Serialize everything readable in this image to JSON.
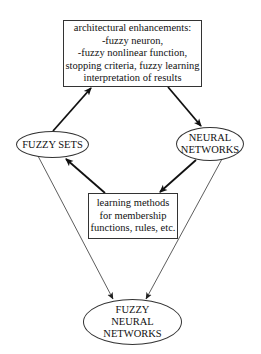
{
  "diagram": {
    "nodes": {
      "enhancements": {
        "shape": "rectangle",
        "lines": [
          "architectural enhancements:",
          "-fuzzy neuron,",
          "-fuzzy nonlinear function,",
          "stopping criteria, fuzzy learning",
          "interpretation of results"
        ]
      },
      "fuzzy_sets": {
        "shape": "ellipse",
        "lines": [
          "FUZZY SETS"
        ]
      },
      "neural_networks": {
        "shape": "ellipse",
        "lines": [
          "NEURAL",
          "NETWORKS"
        ]
      },
      "learning_methods": {
        "shape": "rectangle",
        "lines": [
          "learning methods",
          "for membership",
          "functions, rules, etc."
        ]
      },
      "fuzzy_neural_networks": {
        "shape": "ellipse",
        "lines": [
          "FUZZY",
          "NEURAL",
          "NETWORKS"
        ]
      }
    },
    "edges": [
      {
        "from": "fuzzy_sets",
        "to": "enhancements",
        "style": "thick-arrow"
      },
      {
        "from": "enhancements",
        "to": "neural_networks",
        "style": "thick-arrow"
      },
      {
        "from": "neural_networks",
        "to": "learning_methods",
        "style": "thick-arrow"
      },
      {
        "from": "learning_methods",
        "to": "fuzzy_sets",
        "style": "thick-arrow"
      },
      {
        "from": "fuzzy_sets",
        "to": "fuzzy_neural_networks",
        "style": "thin-arrow"
      },
      {
        "from": "neural_networks",
        "to": "fuzzy_neural_networks",
        "style": "thin-arrow"
      }
    ],
    "colors": {
      "stroke": "#222222",
      "text": "#111111",
      "background": "#ffffff"
    }
  }
}
